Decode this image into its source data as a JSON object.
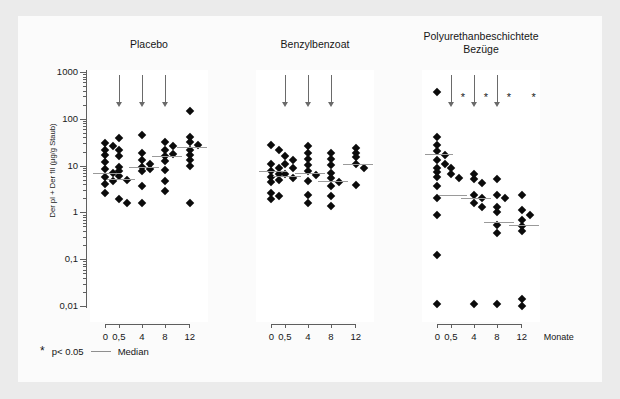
{
  "chart_data": {
    "type": "scatter",
    "title": "",
    "ylabel": "Der pI + Der fII (µg/g Staub)",
    "xlabel": "Monate",
    "yscale": "log",
    "ylim": [
      0.01,
      1000
    ],
    "ytick_labels": [
      "1000",
      "100",
      "10",
      "1",
      "0,1",
      "0,01"
    ],
    "ytick_values": [
      1000,
      100,
      10,
      1,
      0.1,
      0.01
    ],
    "xtick_labels": [
      "0",
      "0,5",
      "4",
      "8",
      "12"
    ],
    "xtick_values": [
      0,
      0.5,
      4,
      8,
      12
    ],
    "grid": false,
    "legend_position": "bottom-left",
    "annotations": {
      "arrow_meaning": "intervention time point",
      "significance_marker": "*"
    },
    "panels": [
      {
        "name": "Placebo",
        "title": "Placebo",
        "arrows_at": [
          0.5,
          4,
          8
        ],
        "stars_at": [],
        "groups": [
          {
            "x_label": "0 / 0,5",
            "medians": [
              7.0,
              5.2
            ],
            "values_left": [
              30,
              26,
              22,
              17,
              12,
              8.5,
              7.0,
              5.8,
              4.8,
              4.0,
              2.6
            ],
            "values_right": [
              38,
              22,
              16,
              9.5,
              7.6,
              6.0,
              5.0,
              1.9,
              1.6
            ]
          },
          {
            "x_label": "4",
            "medians": [
              9.5
            ],
            "values": [
              44,
              19,
              13,
              11,
              9.5,
              8.4,
              7.5,
              3.6,
              1.6
            ]
          },
          {
            "x_label": "8",
            "medians": [
              16.0
            ],
            "values": [
              32,
              26,
              22,
              18,
              16,
              12.5,
              8.0,
              4.6,
              2.9
            ]
          },
          {
            "x_label": "12",
            "medians": [
              25.0
            ],
            "values": [
              150,
              40,
              32,
              27,
              22,
              17,
              13,
              10,
              1.6
            ]
          }
        ]
      },
      {
        "name": "Benzylbenzoat",
        "title": "Benzylbenzoat",
        "arrows_at": [
          0.5,
          4,
          8
        ],
        "stars_at": [],
        "groups": [
          {
            "x_label": "0 / 0,5",
            "medians": [
              7.8,
              6.0
            ],
            "values_left": [
              27,
              22,
              11,
              9.0,
              7.8,
              6.6,
              5.8,
              5.0,
              4.4,
              2.6,
              2.2,
              1.9
            ],
            "values_right": [
              16,
              13,
              11,
              9.0,
              6.5,
              5.4
            ]
          },
          {
            "x_label": "4",
            "medians": [
              7.0
            ],
            "values": [
              26,
              19,
              14,
              10.5,
              7.8,
              6.3,
              4.6,
              2.4,
              1.6
            ]
          },
          {
            "x_label": "8",
            "medians": [
              4.8
            ],
            "values": [
              19,
              14,
              10.5,
              7.0,
              5.4,
              4.4,
              3.6,
              2.2,
              1.4
            ]
          },
          {
            "x_label": "12",
            "medians": [
              11.0
            ],
            "values": [
              24,
              19,
              15,
              11,
              9.0,
              3.8
            ]
          }
        ]
      },
      {
        "name": "Polyurethanbeschichtete Bezüge",
        "title": "Polyurethanbeschichtete\nBezüge",
        "arrows_at": [
          0.5,
          4,
          8
        ],
        "stars_at": [
          0.5,
          4,
          8,
          12
        ],
        "groups": [
          {
            "x_label": "0 / 0,5",
            "medians": [
              18.0,
              2.3
            ],
            "values_left": [
              380,
              40,
              28,
              21,
              17,
              13,
              11,
              9.0,
              7.2,
              5.6,
              3.6,
              2.0,
              0.9,
              0.12,
              0.011
            ],
            "values_right": [
              9.0,
              6.6,
              5.4
            ]
          },
          {
            "x_label": "4",
            "medians": [
              2.0
            ],
            "values": [
              6.5,
              5.2,
              4.2,
              2.4,
              2.0,
              1.6,
              1.3,
              0.011
            ]
          },
          {
            "x_label": "8",
            "medians": [
              0.62
            ],
            "values": [
              5.2,
              2.4,
              2.0,
              1.3,
              1.0,
              0.55,
              0.37,
              0.011
            ]
          },
          {
            "x_label": "12",
            "medians": [
              0.55
            ],
            "values": [
              2.4,
              1.1,
              0.9,
              0.7,
              0.52,
              0.4,
              0.014,
              0.01
            ]
          }
        ]
      }
    ]
  },
  "legend": {
    "star_symbol": "*",
    "significance_text": "p< 0.05",
    "median_text": "Median"
  },
  "axis": {
    "x_unit_label": "Monate"
  }
}
